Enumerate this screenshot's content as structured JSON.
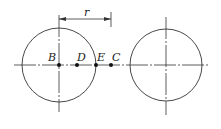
{
  "diagram": {
    "dimension_label": "r",
    "points": [
      {
        "name": "B",
        "x": 59,
        "y": 65
      },
      {
        "name": "D",
        "x": 77,
        "y": 65
      },
      {
        "name": "E",
        "x": 96,
        "y": 65
      },
      {
        "name": "C",
        "x": 111,
        "y": 65
      }
    ],
    "circles": [
      {
        "name": "left-circle",
        "cx": 59,
        "cy": 65,
        "r": 37
      },
      {
        "name": "right-circle",
        "cx": 166,
        "cy": 65,
        "r": 36
      }
    ],
    "colors": {
      "stroke": "#333333",
      "background": "#ffffff"
    }
  }
}
